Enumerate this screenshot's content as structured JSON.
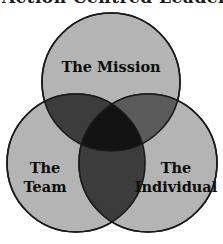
{
  "page": {
    "background_color": "#ffffff",
    "clipped_heading_fragment": "Action Centred Leadership"
  },
  "diagram": {
    "type": "venn-3",
    "stroke_color": "#1a1a1a",
    "circle_fill": "#b4b4b4",
    "pair_overlap_fill": "#3c3c3c",
    "pair_overlap_fill_light": "#5a5a5a",
    "center_overlap_fill": "#121212",
    "circles": [
      {
        "id": "mission",
        "label_lines": [
          "The Mission"
        ],
        "cx": 111,
        "cy": 82,
        "r": 69,
        "fill": "#b4b4b4"
      },
      {
        "id": "team",
        "label_lines": [
          "The",
          "Team"
        ],
        "cx": 76,
        "cy": 163,
        "r": 69,
        "fill": "#b4b4b4"
      },
      {
        "id": "individual",
        "label_lines": [
          "The",
          "Individual"
        ],
        "cx": 148,
        "cy": 163,
        "r": 69,
        "fill": "#b4b4b4"
      }
    ],
    "labels": {
      "mission": "The Mission",
      "team_line1": "The",
      "team_line2": "Team",
      "individual_line1": "The",
      "individual_line2": "Individual"
    }
  }
}
